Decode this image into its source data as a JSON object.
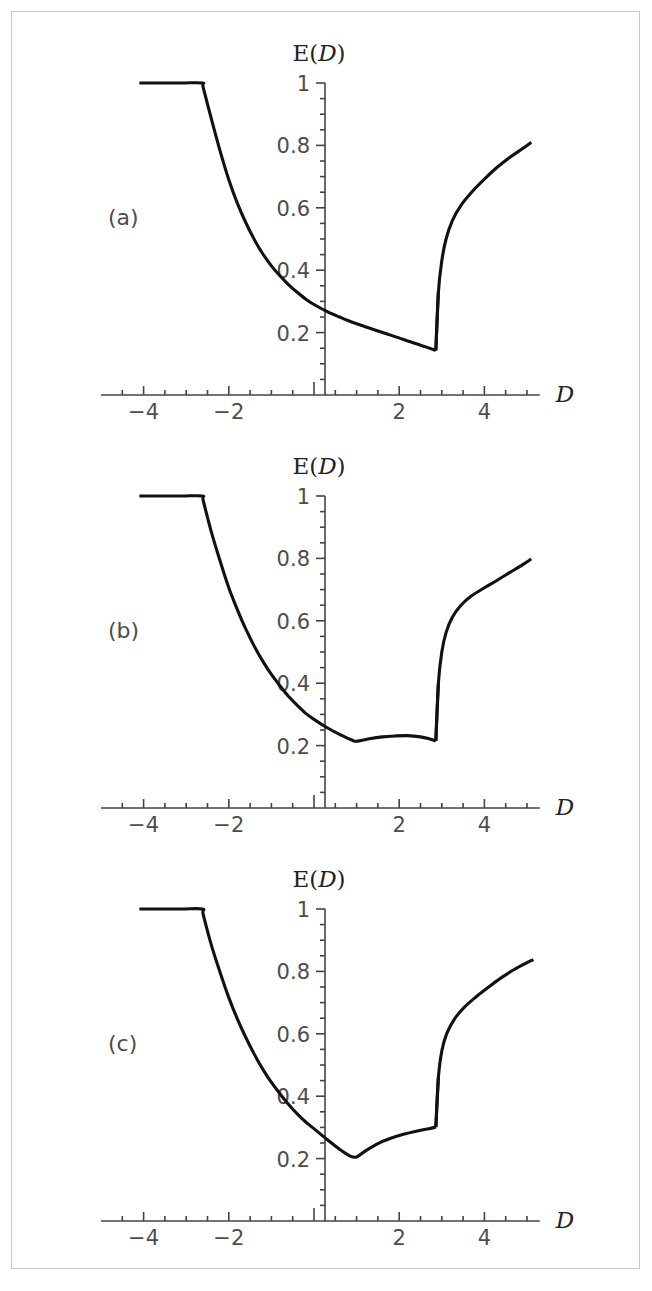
{
  "figure": {
    "panel_count": 3,
    "axis_title_y": "E(D)",
    "axis_title_y_prefix": "E(",
    "axis_title_y_var": "D",
    "axis_title_y_suffix": ")",
    "axis_title_x": "D",
    "curve_color": "#111111",
    "axis_color": "#444444",
    "frame_color": "#c9c9c9",
    "background": "#ffffff"
  },
  "panels": [
    {
      "tag": "(a)"
    },
    {
      "tag": "(b)"
    },
    {
      "tag": "(c)"
    }
  ],
  "axes": {
    "x_ticks_major": [
      -4,
      -2,
      2,
      4
    ],
    "x_tick_labels": [
      "-4",
      "-2",
      "2",
      "4"
    ],
    "x_ticks_minor": [
      -4.5,
      -3.5,
      -3,
      -2.5,
      -1.5,
      -1,
      -0.5,
      0.5,
      1,
      1.5,
      2.5,
      3,
      3.5,
      4.5,
      5
    ],
    "x_zero_tick": 0,
    "x_min": -5.0,
    "x_max": 5.3,
    "y_ticks_major": [
      0.2,
      0.4,
      0.6,
      0.8,
      1.0
    ],
    "y_tick_labels": [
      "0.2",
      "0.4",
      "0.6",
      "0.8",
      "1"
    ],
    "y_ticks_minor": [
      0.05,
      0.1,
      0.15,
      0.25,
      0.3,
      0.35,
      0.45,
      0.5,
      0.55,
      0.65,
      0.7,
      0.75,
      0.85,
      0.9,
      0.95
    ],
    "y_min": 0.0,
    "y_max": 1.0
  },
  "chart_data": [
    {
      "type": "line",
      "title": "E(D)",
      "panel": "(a)",
      "xlabel": "D",
      "ylabel": "E(D)",
      "xlim": [
        -5.0,
        5.3
      ],
      "ylim": [
        0.0,
        1.0
      ],
      "grid": false,
      "legend": "none",
      "series": [
        {
          "name": "E(D) branch a",
          "x": [
            -4.1,
            -3.6,
            -3.1,
            -2.62,
            -2.6,
            -2.4,
            -2.2,
            -2.0,
            -1.8,
            -1.6,
            -1.4,
            -1.2,
            -1.0,
            -0.8,
            -0.6,
            -0.4,
            -0.2,
            0.0,
            0.3,
            0.6,
            0.9,
            1.2,
            1.5,
            1.8,
            2.1,
            2.4,
            2.6,
            2.8,
            2.86
          ],
          "y": [
            1.0,
            1.0,
            1.0,
            1.0,
            0.985,
            0.88,
            0.78,
            0.69,
            0.615,
            0.552,
            0.498,
            0.452,
            0.414,
            0.382,
            0.354,
            0.33,
            0.308,
            0.29,
            0.268,
            0.25,
            0.233,
            0.219,
            0.205,
            0.192,
            0.178,
            0.164,
            0.155,
            0.146,
            0.143
          ]
        },
        {
          "name": "E(D) branch a upper",
          "x": [
            2.86,
            2.92,
            3.0,
            3.1,
            3.25,
            3.45,
            3.7,
            4.0,
            4.3,
            4.6,
            4.9,
            5.1
          ],
          "y": [
            0.143,
            0.33,
            0.43,
            0.5,
            0.56,
            0.608,
            0.65,
            0.692,
            0.73,
            0.762,
            0.79,
            0.81
          ]
        }
      ]
    },
    {
      "type": "line",
      "title": "E(D)",
      "panel": "(b)",
      "xlabel": "D",
      "ylabel": "E(D)",
      "xlim": [
        -5.0,
        5.3
      ],
      "ylim": [
        0.0,
        1.0
      ],
      "grid": false,
      "legend": "none",
      "series": [
        {
          "name": "E(D) branch b",
          "x": [
            -4.1,
            -3.6,
            -3.1,
            -2.62,
            -2.6,
            -2.4,
            -2.2,
            -2.0,
            -1.8,
            -1.6,
            -1.4,
            -1.2,
            -1.0,
            -0.8,
            -0.6,
            -0.4,
            -0.2,
            0.0,
            0.3,
            0.6,
            0.9,
            1.0,
            1.3,
            1.6,
            1.9,
            2.2,
            2.5,
            2.7,
            2.86
          ],
          "y": [
            1.0,
            1.0,
            1.0,
            1.0,
            0.985,
            0.88,
            0.79,
            0.706,
            0.636,
            0.573,
            0.518,
            0.47,
            0.428,
            0.392,
            0.358,
            0.33,
            0.304,
            0.284,
            0.258,
            0.236,
            0.217,
            0.214,
            0.222,
            0.228,
            0.231,
            0.232,
            0.228,
            0.222,
            0.215
          ]
        },
        {
          "name": "E(D) branch b upper",
          "x": [
            2.86,
            2.92,
            3.0,
            3.1,
            3.25,
            3.45,
            3.7,
            4.0,
            4.3,
            4.6,
            4.9,
            5.1
          ],
          "y": [
            0.215,
            0.4,
            0.5,
            0.562,
            0.612,
            0.65,
            0.68,
            0.706,
            0.73,
            0.755,
            0.78,
            0.798
          ]
        }
      ]
    },
    {
      "type": "line",
      "title": "E(D)",
      "panel": "(c)",
      "xlabel": "D",
      "ylabel": "E(D)",
      "xlim": [
        -5.0,
        5.3
      ],
      "ylim": [
        0.0,
        1.0
      ],
      "grid": false,
      "legend": "none",
      "series": [
        {
          "name": "E(D) branch c",
          "x": [
            -4.1,
            -3.6,
            -3.1,
            -2.62,
            -2.6,
            -2.4,
            -2.2,
            -2.0,
            -1.8,
            -1.6,
            -1.4,
            -1.2,
            -1.0,
            -0.8,
            -0.6,
            -0.4,
            -0.2,
            0.0,
            0.3,
            0.6,
            0.85,
            1.0,
            1.2,
            1.5,
            1.8,
            2.1,
            2.4,
            2.7,
            2.86
          ],
          "y": [
            1.0,
            1.0,
            1.0,
            1.0,
            0.982,
            0.88,
            0.795,
            0.716,
            0.648,
            0.588,
            0.534,
            0.486,
            0.444,
            0.408,
            0.374,
            0.344,
            0.318,
            0.296,
            0.262,
            0.23,
            0.208,
            0.205,
            0.224,
            0.248,
            0.265,
            0.278,
            0.288,
            0.296,
            0.301
          ]
        },
        {
          "name": "E(D) branch c upper",
          "x": [
            2.86,
            2.92,
            3.0,
            3.12,
            3.3,
            3.52,
            3.8,
            4.1,
            4.4,
            4.7,
            5.0,
            5.15
          ],
          "y": [
            0.301,
            0.46,
            0.545,
            0.602,
            0.648,
            0.684,
            0.718,
            0.75,
            0.78,
            0.806,
            0.828,
            0.838
          ]
        }
      ]
    }
  ]
}
